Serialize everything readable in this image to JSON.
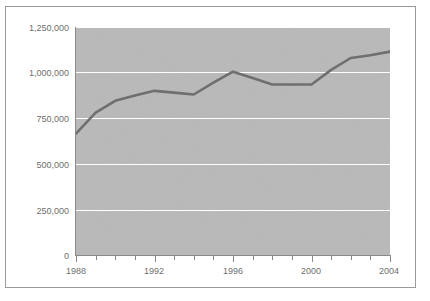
{
  "chart_data": {
    "type": "line",
    "title": "",
    "subtitle": "",
    "xlabel": "",
    "ylabel": "",
    "x": [
      1988,
      1989,
      1990,
      1991,
      1992,
      1993,
      1994,
      1995,
      1996,
      1997,
      1998,
      1999,
      2000,
      2001,
      2002,
      2003,
      2004
    ],
    "values": [
      665000,
      780000,
      845000,
      875000,
      900000,
      890000,
      880000,
      945000,
      1005000,
      970000,
      935000,
      935000,
      935000,
      1015000,
      1080000,
      1095000,
      1115000
    ],
    "series": [
      {
        "name": "series-1",
        "values": [
          665000,
          780000,
          845000,
          875000,
          900000,
          890000,
          880000,
          945000,
          1005000,
          970000,
          935000,
          935000,
          935000,
          1015000,
          1080000,
          1095000,
          1115000
        ]
      }
    ],
    "xlim": [
      1988,
      2004
    ],
    "ylim": [
      0,
      1250000
    ],
    "ytick_values": [
      0,
      250000,
      500000,
      750000,
      1000000,
      1250000
    ],
    "ytick_labels": [
      "0",
      "250,000",
      "500,000",
      "750,000",
      "1,000,000",
      "1,250,000"
    ],
    "xtick_values": [
      1988,
      1992,
      1996,
      2000,
      2004
    ],
    "xtick_labels": [
      "1988",
      "1992",
      "1996",
      "2000",
      "2004"
    ],
    "xtick_minor_values": [
      1989,
      1990,
      1991,
      1993,
      1994,
      1995,
      1997,
      1998,
      1999,
      2001,
      2002,
      2003
    ],
    "grid": {
      "horizontal": true,
      "vertical": false,
      "color": "#ffffff"
    },
    "legend": {
      "visible": false,
      "position": "none",
      "entries": []
    },
    "colors": {
      "line": "#6f6f6f",
      "plot_background": "#b9b9b9",
      "figure_background": "#ffffff",
      "frame_border": "#9a9a9a",
      "axis": "#8a8a8a",
      "tick_label": "#6e6e6e",
      "gridline": "#ffffff"
    },
    "annotations": []
  }
}
